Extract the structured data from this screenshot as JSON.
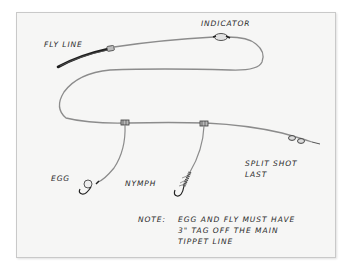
{
  "diagram": {
    "type": "fly-fishing-rig-sketch",
    "labels": {
      "fly_line": "FLY LINE",
      "indicator": "INDICATOR",
      "egg": "EGG",
      "nymph": "NYMPH",
      "split_shot_line1": "SPLIT SHOT",
      "split_shot_line2": "LAST"
    },
    "note": {
      "prefix": "NOTE:",
      "line1": "EGG AND FLY MUST HAVE",
      "line2": "3\" TAG OFF THE MAIN",
      "line3": "TIPPET LINE"
    },
    "colors": {
      "background": "#ffffff",
      "paper": "#f6f6f5",
      "frame_border": "#c9c9c9",
      "line": "#8a8a8a",
      "ink": "#2a2a2a",
      "fly_line": "#1e1e1e"
    }
  }
}
